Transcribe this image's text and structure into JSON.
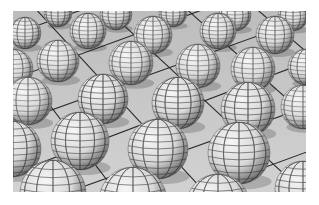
{
  "image": {
    "description": "3D rendered grid of wireframe-striped spheres on a tiled floor in perspective",
    "colors": {
      "floor": "#c8c8c8",
      "grid_line": "#2a2a2a",
      "sphere_light": "#f4f4f4",
      "sphere_dark": "#555555",
      "sphere_line": "#333333"
    },
    "spheres": [
      {
        "cx": 45,
        "cy": 2,
        "r": 14
      },
      {
        "cx": 103,
        "cy": 3,
        "r": 16
      },
      {
        "cx": 160,
        "cy": 2,
        "r": 14
      },
      {
        "cx": 222,
        "cy": 4,
        "r": 16
      },
      {
        "cx": 280,
        "cy": 5,
        "r": 15
      },
      {
        "cx": 12,
        "cy": 22,
        "r": 16
      },
      {
        "cx": 75,
        "cy": 20,
        "r": 18
      },
      {
        "cx": 140,
        "cy": 24,
        "r": 19
      },
      {
        "cx": 205,
        "cy": 20,
        "r": 18
      },
      {
        "cx": 262,
        "cy": 24,
        "r": 19
      },
      {
        "cx": 0,
        "cy": 58,
        "r": 20
      },
      {
        "cx": 45,
        "cy": 50,
        "r": 21
      },
      {
        "cx": 118,
        "cy": 52,
        "r": 22
      },
      {
        "cx": 185,
        "cy": 55,
        "r": 22
      },
      {
        "cx": 240,
        "cy": 58,
        "r": 22
      },
      {
        "cx": 293,
        "cy": 56,
        "r": 18
      },
      {
        "cx": 15,
        "cy": 90,
        "r": 24
      },
      {
        "cx": 90,
        "cy": 88,
        "r": 25
      },
      {
        "cx": 165,
        "cy": 92,
        "r": 26
      },
      {
        "cx": 235,
        "cy": 98,
        "r": 27
      },
      {
        "cx": 290,
        "cy": 96,
        "r": 22
      },
      {
        "cx": 0,
        "cy": 138,
        "r": 28
      },
      {
        "cx": 67,
        "cy": 130,
        "r": 29
      },
      {
        "cx": 145,
        "cy": 138,
        "r": 30
      },
      {
        "cx": 226,
        "cy": 142,
        "r": 31
      },
      {
        "cx": 40,
        "cy": 182,
        "r": 33
      },
      {
        "cx": 120,
        "cy": 190,
        "r": 34
      },
      {
        "cx": 205,
        "cy": 195,
        "r": 32
      },
      {
        "cx": 290,
        "cy": 178,
        "r": 28
      }
    ],
    "grid_lines": [
      {
        "x1": -20,
        "y1": 30,
        "x2": 80,
        "y2": -5
      },
      {
        "x1": -20,
        "y1": 75,
        "x2": 200,
        "y2": -5
      },
      {
        "x1": -20,
        "y1": 120,
        "x2": 300,
        "y2": 5
      },
      {
        "x1": -20,
        "y1": 170,
        "x2": 310,
        "y2": 45
      },
      {
        "x1": 30,
        "y1": 190,
        "x2": 310,
        "y2": 90
      },
      {
        "x1": 160,
        "y1": 190,
        "x2": 310,
        "y2": 135
      },
      {
        "x1": 20,
        "y1": -5,
        "x2": 200,
        "y2": 190
      },
      {
        "x1": 90,
        "y1": -5,
        "x2": 300,
        "y2": 190
      },
      {
        "x1": 170,
        "y1": -5,
        "x2": 310,
        "y2": 120
      },
      {
        "x1": 240,
        "y1": -5,
        "x2": 310,
        "y2": 55
      },
      {
        "x1": -20,
        "y1": 20,
        "x2": 110,
        "y2": 190
      },
      {
        "x1": -20,
        "y1": 100,
        "x2": 40,
        "y2": 190
      }
    ]
  }
}
